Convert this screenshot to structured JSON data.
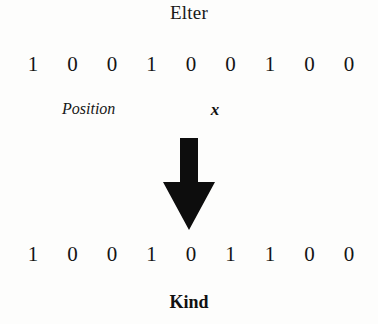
{
  "figure": {
    "title": "Elter",
    "bottom_caption": "Kind",
    "position_label": "Position",
    "pointer_label": "x",
    "arrow_icon": "down-arrow-icon",
    "pointer_index": 5,
    "bits_before": [
      "1",
      "0",
      "0",
      "1",
      "0",
      "0",
      "1",
      "0",
      "0"
    ],
    "bits_after": [
      "1",
      "0",
      "0",
      "1",
      "0",
      "1",
      "1",
      "0",
      "0"
    ],
    "colors": {
      "ink": "#111111",
      "background": "#fdfdfc",
      "arrow": "#0d0d0d"
    }
  }
}
